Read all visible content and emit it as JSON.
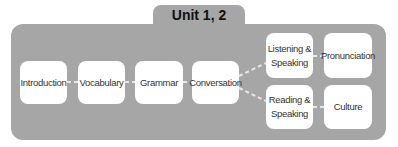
{
  "diagram": {
    "title": "Unit 1, 2",
    "nodes": [
      {
        "id": "introduction",
        "label": "Introduction"
      },
      {
        "id": "vocabulary",
        "label": "Vocabulary"
      },
      {
        "id": "grammar",
        "label": "Grammar"
      },
      {
        "id": "conversation",
        "label": "Conversation"
      },
      {
        "id": "listening-speaking",
        "label": "Listening & Speaking"
      },
      {
        "id": "pronunciation",
        "label": "Pronunciation"
      },
      {
        "id": "reading-speaking",
        "label": "Reading & Speaking"
      },
      {
        "id": "culture",
        "label": "Culture"
      }
    ],
    "edges": [
      [
        "introduction",
        "vocabulary"
      ],
      [
        "vocabulary",
        "grammar"
      ],
      [
        "grammar",
        "conversation"
      ],
      [
        "conversation",
        "listening-speaking"
      ],
      [
        "conversation",
        "reading-speaking"
      ],
      [
        "listening-speaking",
        "pronunciation"
      ],
      [
        "reading-speaking",
        "culture"
      ]
    ],
    "colors": {
      "panel": "#a6a6a6",
      "node": "#ffffff",
      "connector": "#e8e8e8"
    }
  }
}
